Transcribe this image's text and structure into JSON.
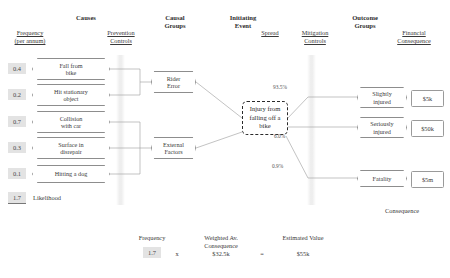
{
  "diagram": {
    "column_headers": {
      "causes": "Causes",
      "causal_groups_line1": "Causal",
      "causal_groups_line2": "Groups",
      "initiating_event_line1": "Initiating",
      "initiating_event_line2": "Event",
      "outcome_groups_line1": "Outcome",
      "outcome_groups_line2": "Groups"
    },
    "sub_headers": {
      "frequency_line1": "Frequency",
      "frequency_line2": "(per annum)",
      "prevention_line1": "Prevention",
      "prevention_line2": "Controls",
      "spread": "Spread",
      "mitigation_line1": "Mitigation",
      "mitigation_line2": "Controls",
      "financial_line1": "Financial",
      "financial_line2": "Consequence"
    },
    "causes": [
      {
        "frequency": "0.4",
        "line1": "Fall from",
        "line2": "bike",
        "group": "rider-error"
      },
      {
        "frequency": "0.2",
        "line1": "Hit stationary",
        "line2": "object",
        "group": "rider-error"
      },
      {
        "frequency": "0.7",
        "line1": "Collision",
        "line2": "with car",
        "group": "external-factors"
      },
      {
        "frequency": "0.3",
        "line1": "Surface in",
        "line2": "disrepair",
        "group": "external-factors"
      },
      {
        "frequency": "0.1",
        "line1": "Hitting a dog",
        "line2": "",
        "group": "external-factors"
      }
    ],
    "causal_groups": [
      {
        "line1": "Rider",
        "line2": "Error"
      },
      {
        "line1": "External",
        "line2": "Factors"
      }
    ],
    "initiating_event": {
      "line1": "Injury from",
      "line2": "falling off a",
      "line3": "bike"
    },
    "outcomes": [
      {
        "spread": "93.5%",
        "line1": "Slightly",
        "line2": "injured",
        "value": "$5k"
      },
      {
        "spread": "6.0%",
        "line1": "Seriously",
        "line2": "injured",
        "value": "$50k"
      },
      {
        "spread": "0.9%",
        "line1": "Fatality",
        "line2": "",
        "value": "$5m"
      }
    ],
    "likelihood": {
      "value": "1.7",
      "label": "Likelihood"
    },
    "consequence_label": "Consequence",
    "summary": {
      "frequency_label": "Frequency",
      "frequency_value": "1.7",
      "times_symbol": "x",
      "weighted_label_line1": "Weighted Av.",
      "weighted_label_line2": "Consequence",
      "weighted_value": "$32.5k",
      "equals_symbol": "=",
      "estimated_label": "Estimated Value",
      "estimated_value": "$55k"
    },
    "colors": {
      "chip_bg": "#e3e3e3",
      "line": "#8d8d8d",
      "event_border": "#2b2b2b",
      "text": "#3a3a3a"
    }
  }
}
